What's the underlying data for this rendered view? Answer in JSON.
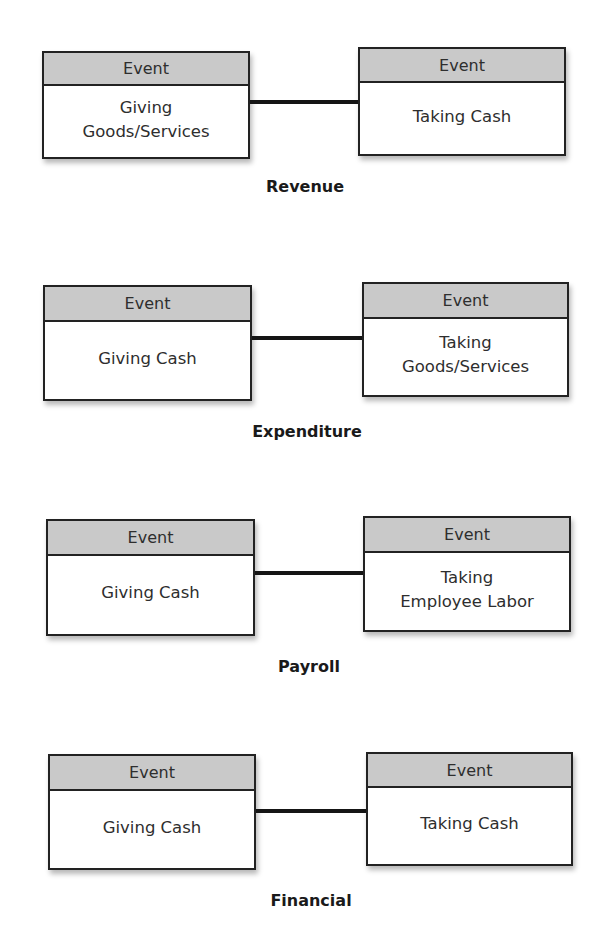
{
  "diagrams": [
    {
      "name": "Revenue",
      "left": {
        "header": "Event",
        "body": "Giving\nGoods/Services"
      },
      "right": {
        "header": "Event",
        "body": "Taking Cash"
      }
    },
    {
      "name": "Expenditure",
      "left": {
        "header": "Event",
        "body": "Giving Cash"
      },
      "right": {
        "header": "Event",
        "body": "Taking\nGoods/Services"
      }
    },
    {
      "name": "Payroll",
      "left": {
        "header": "Event",
        "body": "Giving Cash"
      },
      "right": {
        "header": "Event",
        "body": "Taking\nEmployee Labor"
      }
    },
    {
      "name": "Financial",
      "left": {
        "header": "Event",
        "body": "Giving Cash"
      },
      "right": {
        "header": "Event",
        "body": "Taking Cash"
      }
    }
  ],
  "colors": {
    "header_fill": "#c9c9c9",
    "border": "#222222",
    "connector": "#151515"
  }
}
